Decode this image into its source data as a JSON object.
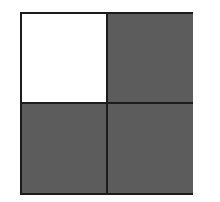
{
  "diagram": {
    "type": "fraction-grid",
    "rows": 2,
    "columns": 2,
    "cells": [
      {
        "row": 0,
        "col": 0,
        "shaded": false
      },
      {
        "row": 0,
        "col": 1,
        "shaded": true
      },
      {
        "row": 1,
        "col": 0,
        "shaded": true
      },
      {
        "row": 1,
        "col": 1,
        "shaded": true
      }
    ],
    "shaded_count": 3,
    "total_count": 4,
    "colors": {
      "border": "#1c1c1c",
      "shade": "#8e8e8e",
      "unshaded": "#ffffff"
    }
  }
}
